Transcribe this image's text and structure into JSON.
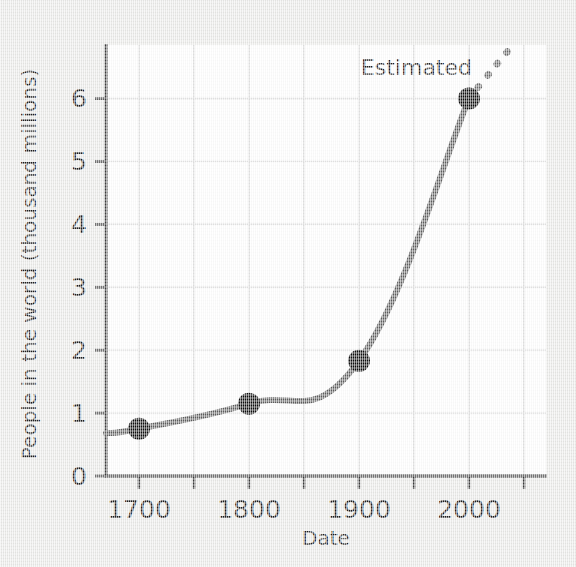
{
  "figure": {
    "background_color": "#e9e9e7",
    "plot_background_color": "#ffffff",
    "line_color": "#5f5f5f",
    "marker_color": "#0d0d0d",
    "grid_color": "#d8d8d8",
    "axis_color": "#3b3b3b"
  },
  "chart_data": {
    "type": "line",
    "title": "",
    "subtitle": "",
    "xlabel": "Date",
    "ylabel": "People in the world (thousand millions)",
    "x": [
      1700,
      1800,
      1900,
      2000
    ],
    "values": [
      0.75,
      1.15,
      1.83,
      6.0
    ],
    "series": [
      {
        "name": "World population",
        "x": [
          1700,
          1800,
          1900,
          2000
        ],
        "values": [
          0.75,
          1.15,
          1.83,
          6.0
        ],
        "style": "solid",
        "markers": true
      },
      {
        "name": "Estimated",
        "x": [
          2000,
          2040
        ],
        "values": [
          6.0,
          6.85
        ],
        "style": "dotted",
        "markers": false
      }
    ],
    "xlim": [
      1670,
      2070
    ],
    "ylim": [
      0,
      6.85
    ],
    "xticks": [
      1700,
      1800,
      1900,
      2000
    ],
    "xtick_labels": [
      "1700",
      "1800",
      "1900",
      "2000"
    ],
    "xminor_ticks": [
      1750,
      1850,
      1950,
      2050
    ],
    "yticks": [
      0,
      1,
      2,
      3,
      4,
      5,
      6
    ],
    "ytick_labels": [
      "0",
      "1",
      "2",
      "3",
      "4",
      "5",
      "6"
    ],
    "grid": true,
    "grid_axis": "both",
    "legend": "none",
    "annotations": [
      {
        "text": "Estimated",
        "x": 1975,
        "y": 6.55
      }
    ]
  }
}
